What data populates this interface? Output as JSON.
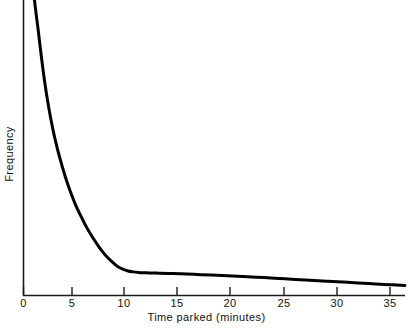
{
  "chart_data": {
    "type": "line",
    "title": "",
    "subtitle": "",
    "xlabel": "Time parked (minutes)",
    "ylabel": "Frequency",
    "xlim": [
      0,
      36.5
    ],
    "ylim": [
      0,
      1
    ],
    "grid": false,
    "legend": false,
    "xticks": [
      0,
      5,
      10,
      15,
      20,
      25,
      30,
      35
    ],
    "xtick_labels": [
      "0",
      "5",
      "10",
      "15",
      "20",
      "25",
      "30",
      "35"
    ],
    "yticks": [],
    "ytick_labels": [],
    "annotations": [],
    "series": [
      {
        "name": "Parking duration frequency",
        "color": "#000000",
        "line_width": 3,
        "x": [
          1.05,
          1.2,
          1.4,
          1.6,
          1.9,
          2.2,
          2.6,
          3.0,
          3.5,
          4.0,
          4.5,
          5.0,
          5.5,
          6.0,
          6.5,
          7.0,
          7.5,
          8.0,
          8.5,
          9.0,
          9.5,
          10.0,
          10.5,
          11.0,
          11.5,
          12.0,
          13.0,
          14.0,
          15.0,
          17.0,
          19.0,
          21.0,
          23.0,
          25.0,
          27.0,
          29.0,
          31.0,
          33.0,
          35.0,
          36.5
        ],
        "y": [
          1.0,
          0.955,
          0.9,
          0.84,
          0.755,
          0.682,
          0.6,
          0.532,
          0.462,
          0.402,
          0.35,
          0.305,
          0.268,
          0.233,
          0.203,
          0.176,
          0.151,
          0.13,
          0.113,
          0.098,
          0.089,
          0.083,
          0.08,
          0.078,
          0.077,
          0.0765,
          0.0755,
          0.0745,
          0.0735,
          0.0705,
          0.0675,
          0.0645,
          0.0605,
          0.0565,
          0.0525,
          0.0485,
          0.0445,
          0.0405,
          0.0365,
          0.034
        ]
      }
    ]
  },
  "axes": {
    "x_title": "Time parked (minutes)",
    "y_title": "Frequency",
    "tick_labels": [
      "0",
      "5",
      "10",
      "15",
      "20",
      "25",
      "30",
      "35"
    ]
  },
  "colors": {
    "curve": "#000000",
    "axis": "#1a1a1a",
    "background": "#ffffff",
    "text": "#111111"
  }
}
